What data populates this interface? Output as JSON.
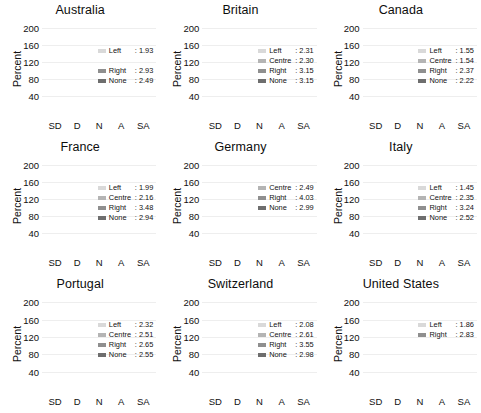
{
  "chart_data": {
    "type": "bar",
    "subtype": "stacked",
    "title": "",
    "xlabel": "",
    "ylabel": "Percent",
    "ylim": [
      0,
      215
    ],
    "yticks": [
      40,
      80,
      120,
      160,
      200
    ],
    "categories": [
      "SD",
      "D",
      "N",
      "A",
      "SA"
    ],
    "grid": true,
    "legend_position": "top-right inside panel",
    "series_order": [
      "Left",
      "Centre",
      "Right",
      "None"
    ],
    "series_colors": {
      "Left": "#d9d9d9",
      "Centre": "#b4b4b4",
      "Right": "#8f8f8f",
      "None": "#6e6e6e"
    },
    "panels": [
      {
        "title": "Australia",
        "legend": [
          {
            "name": "Left",
            "value": "1.93",
            "color": "#d9d9d9"
          },
          {
            "name": "Centre",
            "value": "",
            "color": "transparent"
          },
          {
            "name": "Right",
            "value": "2.93",
            "color": "#8f8f8f"
          },
          {
            "name": "None",
            "value": "2.49",
            "color": "#6e6e6e"
          }
        ],
        "series": [
          {
            "name": "Left",
            "values": [
              40,
              28,
              13,
              5,
              2
            ]
          },
          {
            "name": "Centre",
            "values": [
              0,
              0,
              0,
              0,
              0
            ]
          },
          {
            "name": "Right",
            "values": [
              0,
              0,
              0,
              0,
              0
            ]
          },
          {
            "name": "None",
            "values": [
              45,
              62,
              33,
              35,
              30
            ]
          }
        ]
      },
      {
        "title": "Britain",
        "legend": [
          {
            "name": "Left",
            "value": "2.31",
            "color": "#d9d9d9"
          },
          {
            "name": "Centre",
            "value": "2.30",
            "color": "#b4b4b4"
          },
          {
            "name": "Right",
            "value": "3.15",
            "color": "#8f8f8f"
          },
          {
            "name": "None",
            "value": "3.15",
            "color": "#6e6e6e"
          }
        ],
        "series": [
          {
            "name": "Left",
            "values": [
              26,
              18,
              11,
              22,
              6
            ]
          },
          {
            "name": "Centre",
            "values": [
              27,
              21,
              20,
              26,
              15
            ]
          },
          {
            "name": "Right",
            "values": [
              30,
              29,
              19,
              25,
              17
            ]
          },
          {
            "name": "None",
            "values": [
              24,
              19,
              15,
              22,
              12
            ]
          }
        ]
      },
      {
        "title": "Canada",
        "legend": [
          {
            "name": "Left",
            "value": "1.55",
            "color": "#d9d9d9"
          },
          {
            "name": "Centre",
            "value": "1.54",
            "color": "#b4b4b4"
          },
          {
            "name": "Right",
            "value": "2.37",
            "color": "#8f8f8f"
          },
          {
            "name": "None",
            "value": "2.22",
            "color": "#6e6e6e"
          }
        ],
        "series": [
          {
            "name": "Left",
            "values": [
              74,
              22,
              0,
              0,
              0
            ]
          },
          {
            "name": "Centre",
            "values": [
              58,
              17,
              2,
              2,
              1
            ]
          },
          {
            "name": "Right",
            "values": [
              38,
              27,
              9,
              12,
              6
            ]
          },
          {
            "name": "None",
            "values": [
              40,
              35,
              21,
              24,
              18
            ]
          }
        ]
      },
      {
        "title": "France",
        "legend": [
          {
            "name": "Left",
            "value": "1.99",
            "color": "#d9d9d9"
          },
          {
            "name": "Centre",
            "value": "2.16",
            "color": "#b4b4b4"
          },
          {
            "name": "Right",
            "value": "3.48",
            "color": "#8f8f8f"
          },
          {
            "name": "None",
            "value": "2.94",
            "color": "#6e6e6e"
          }
        ],
        "series": [
          {
            "name": "Left",
            "values": [
              30,
              26,
              9,
              8,
              5
            ]
          },
          {
            "name": "Centre",
            "values": [
              28,
              32,
              9,
              5,
              5
            ]
          },
          {
            "name": "Right",
            "values": [
              22,
              25,
              18,
              35,
              24
            ]
          },
          {
            "name": "None",
            "values": [
              27,
              31,
              27,
              26,
              19
            ]
          }
        ]
      },
      {
        "title": "Germany",
        "legend": [
          {
            "name": "Centre",
            "value": "2.49",
            "color": "#b4b4b4"
          },
          {
            "name": "Right",
            "value": "4.03",
            "color": "#8f8f8f"
          },
          {
            "name": "None",
            "value": "2.99",
            "color": "#6e6e6e"
          }
        ],
        "series": [
          {
            "name": "Left",
            "values": [
              0,
              0,
              0,
              0,
              0
            ]
          },
          {
            "name": "Centre",
            "values": [
              10,
              12,
              11,
              11,
              10
            ]
          },
          {
            "name": "Right",
            "values": [
              15,
              30,
              28,
              28,
              35
            ]
          },
          {
            "name": "None",
            "values": [
              20,
              24,
              23,
              24,
              26
            ]
          }
        ]
      },
      {
        "title": "Italy",
        "legend": [
          {
            "name": "Left",
            "value": "1.45",
            "color": "#d9d9d9"
          },
          {
            "name": "Centre",
            "value": "2.35",
            "color": "#b4b4b4"
          },
          {
            "name": "Right",
            "value": "3.24",
            "color": "#8f8f8f"
          },
          {
            "name": "None",
            "value": "2.52",
            "color": "#6e6e6e"
          }
        ],
        "series": [
          {
            "name": "Left",
            "values": [
              65,
              40,
              3,
              3,
              2
            ]
          },
          {
            "name": "Centre",
            "values": [
              20,
              25,
              6,
              19,
              14
            ]
          },
          {
            "name": "Right",
            "values": [
              20,
              19,
              15,
              14,
              12
            ]
          },
          {
            "name": "None",
            "values": [
              38,
              24,
              14,
              22,
              21
            ]
          }
        ]
      },
      {
        "title": "Portugal",
        "legend": [
          {
            "name": "Left",
            "value": "2.32",
            "color": "#d9d9d9"
          },
          {
            "name": "Centre",
            "value": "2.51",
            "color": "#b4b4b4"
          },
          {
            "name": "Right",
            "value": "2.65",
            "color": "#8f8f8f"
          },
          {
            "name": "None",
            "value": "2.55",
            "color": "#6e6e6e"
          }
        ],
        "series": [
          {
            "name": "Left",
            "values": [
              12,
              57,
              6,
              12,
              4
            ]
          },
          {
            "name": "Centre",
            "values": [
              13,
              38,
              7,
              16,
              7
            ]
          },
          {
            "name": "Right",
            "values": [
              13,
              36,
              10,
              16,
              9
            ]
          },
          {
            "name": "None",
            "values": [
              24,
              69,
              24,
              24,
              13
            ]
          }
        ]
      },
      {
        "title": "Switzerland",
        "legend": [
          {
            "name": "Left",
            "value": "2.08",
            "color": "#d9d9d9"
          },
          {
            "name": "Centre",
            "value": "2.61",
            "color": "#b4b4b4"
          },
          {
            "name": "Right",
            "value": "3.55",
            "color": "#8f8f8f"
          },
          {
            "name": "None",
            "value": "2.98",
            "color": "#6e6e6e"
          }
        ],
        "series": [
          {
            "name": "Left",
            "values": [
              23,
              33,
              10,
              13,
              3
            ]
          },
          {
            "name": "Centre",
            "values": [
              19,
              22,
              8,
              14,
              4
            ]
          },
          {
            "name": "Right",
            "values": [
              16,
              25,
              22,
              36,
              19
            ]
          },
          {
            "name": "None",
            "values": [
              18,
              35,
              32,
              35,
              19
            ]
          }
        ]
      },
      {
        "title": "United States",
        "legend": [
          {
            "name": "Left",
            "value": "1.86",
            "color": "#d9d9d9"
          },
          {
            "name": "Right",
            "value": "2.83",
            "color": "#8f8f8f"
          }
        ],
        "series": [
          {
            "name": "Left",
            "values": [
              22,
              16,
              12,
              6,
              0
            ]
          },
          {
            "name": "Centre",
            "values": [
              0,
              0,
              0,
              0,
              0
            ]
          },
          {
            "name": "Right",
            "values": [
              25,
              35,
              28,
              24,
              0
            ]
          },
          {
            "name": "None",
            "values": [
              4,
              3,
              3,
              3,
              3
            ]
          }
        ]
      }
    ]
  }
}
